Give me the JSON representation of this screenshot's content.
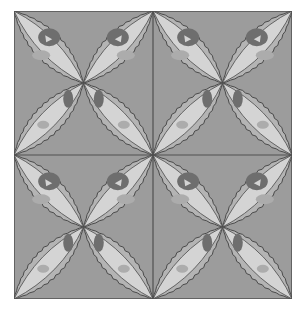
{
  "image": {
    "subject": "Quilt block pattern with four-petal lens motifs",
    "blocks": {
      "rows": 2,
      "cols": 2
    },
    "petals_per_block": 4
  },
  "colors": {
    "background": "#9c9c9c",
    "grid_line": "#505050",
    "petal_band": "#b4b4b4",
    "petal_outline": "#4a4a4a",
    "petal_inner": "#d4d4d4",
    "blob_dark": "#6e6e6e",
    "blob_mid": "#acacac",
    "page": "#ffffff"
  }
}
